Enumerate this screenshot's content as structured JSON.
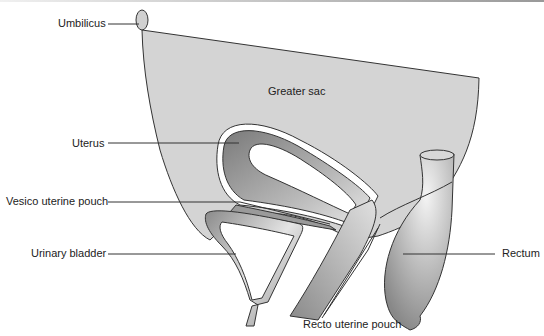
{
  "diagram": {
    "labels": {
      "umbilicus": "Umbilicus",
      "greater_sac": "Greater sac",
      "uterus": "Uterus",
      "vesico_uterine_pouch": "Vesico uterine pouch",
      "urinary_bladder": "Urinary bladder",
      "rectum": "Rectum",
      "recto_uterine_pouch": "Recto uterine pouch"
    },
    "colors": {
      "peritoneum_fill": "#d4d4d4",
      "outline": "#333333",
      "organ_dark": "#8a8a8a",
      "organ_light": "#e6e6e6"
    }
  }
}
